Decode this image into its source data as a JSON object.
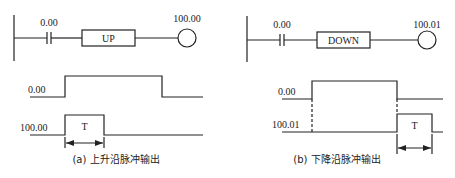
{
  "colors": {
    "ink": "#222222",
    "background": "#ffffff"
  },
  "panel_a": {
    "ladder": {
      "contact_label": "0.00",
      "instruction_label": "UP",
      "coil_label": "100.00"
    },
    "timing": {
      "input_label": "0.00",
      "output_label": "100.00",
      "pulse_width_label": "T"
    },
    "caption": "(a) 上升沿脉冲输出"
  },
  "panel_b": {
    "ladder": {
      "contact_label": "0.00",
      "instruction_label": "DOWN",
      "coil_label": "100.01"
    },
    "timing": {
      "input_label": "0.00",
      "output_label": "100.01",
      "pulse_width_label": "T"
    },
    "caption": "(b) 下降沿脉冲输出"
  }
}
